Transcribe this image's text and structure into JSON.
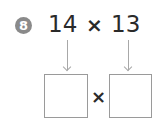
{
  "problem": {
    "number": "8",
    "factor1": "14",
    "operator": "×",
    "factor2": "13"
  },
  "answer": {
    "operator": "×",
    "box1_value": "",
    "box2_value": ""
  },
  "colors": {
    "badge": "#8a8a8a",
    "text": "#2a2a2a",
    "arrow": "#a8a8a8",
    "box_border": "#9a9a9a"
  }
}
